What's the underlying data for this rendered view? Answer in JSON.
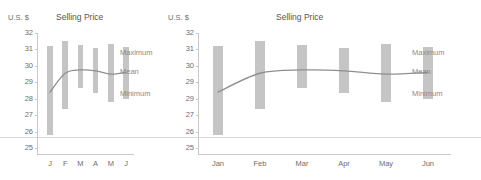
{
  "chart_data": [
    {
      "id": "left",
      "type": "bar",
      "title": "Selling Price",
      "ylabel": "U.S. $",
      "xlabel": "",
      "categories": [
        "J",
        "F",
        "M",
        "A",
        "M",
        "J"
      ],
      "ylim": [
        25,
        32
      ],
      "yticks": [
        "32",
        "31",
        "30",
        "29",
        "28",
        "27",
        "26",
        "25"
      ],
      "grid": false,
      "legend_position": "right-inline",
      "series": [
        {
          "name": "Maximum",
          "values": [
            31.2,
            31.5,
            31.3,
            31.1,
            31.35,
            31.15
          ]
        },
        {
          "name": "Minimum",
          "values": [
            25.8,
            27.4,
            28.65,
            28.35,
            27.8,
            28.0
          ]
        },
        {
          "name": "Mean",
          "values": [
            28.4,
            29.55,
            29.75,
            29.7,
            29.5,
            29.6
          ]
        }
      ],
      "annotations": [
        "Maximum",
        "Mean",
        "Minimum"
      ]
    },
    {
      "id": "right",
      "type": "bar",
      "title": "Selling Price",
      "ylabel": "U.S. $",
      "xlabel": "",
      "categories": [
        "Jan",
        "Feb",
        "Mar",
        "Apr",
        "May",
        "Jun"
      ],
      "ylim": [
        25,
        32
      ],
      "yticks": [
        "32",
        "31",
        "30",
        "29",
        "29",
        "27",
        "26",
        "25"
      ],
      "grid": false,
      "legend_position": "right-inline",
      "series": [
        {
          "name": "Maximum",
          "values": [
            31.2,
            31.5,
            31.3,
            31.1,
            31.35,
            31.15
          ]
        },
        {
          "name": "Minimum",
          "values": [
            25.8,
            27.4,
            28.65,
            28.35,
            27.8,
            28.0
          ]
        },
        {
          "name": "Mean",
          "values": [
            28.4,
            29.55,
            29.75,
            29.7,
            29.5,
            29.6
          ]
        }
      ],
      "annotations": [
        "Maximum",
        "Mean",
        "Minimum"
      ]
    }
  ],
  "left": {
    "unit": "U.S. $",
    "title": "Selling Price",
    "yticks": [
      "32",
      "31",
      "30",
      "29",
      "28",
      "27",
      "26",
      "25"
    ],
    "xticks": [
      "J",
      "F",
      "M",
      "A",
      "M",
      "J"
    ],
    "ann_max": "Maximum",
    "ann_mean": "Mean",
    "ann_min": "Minimum"
  },
  "right": {
    "unit": "U.S. $",
    "title": "Selling Price",
    "yticks": [
      "32",
      "31",
      "30",
      "29",
      "29",
      "27",
      "26",
      "25"
    ],
    "xticks": [
      "Jan",
      "Feb",
      "Mar",
      "Apr",
      "May",
      "Jun"
    ],
    "ann_max": "Maximum",
    "ann_mean": "Mean",
    "ann_min": "Minimum"
  },
  "colors": {
    "bar": "#c5c5c5",
    "mean_line": "#8f8f8f",
    "axis": "#c9c9c9",
    "tick_text": "#6d6d6d",
    "annotation_text": "#8a8a8a",
    "title_text": "#555555"
  }
}
